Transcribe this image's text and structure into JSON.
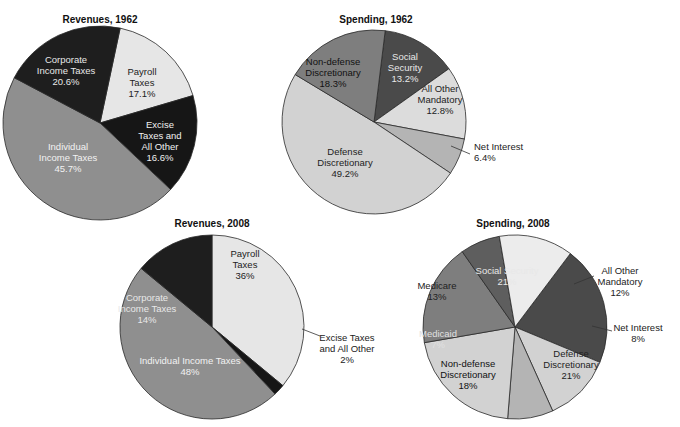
{
  "chart_data": [
    {
      "type": "pie",
      "title": "Revenues, 1962",
      "slices": [
        {
          "label": [
            "Payroll",
            "Taxes",
            "17.1%"
          ],
          "name": "Payroll Taxes",
          "value": 17.1,
          "color": "#e6e6e6",
          "text_color": "#222222"
        },
        {
          "label": [
            "Excise",
            "Taxes and",
            "All Other",
            "16.6%"
          ],
          "name": "Excise Taxes and All Other",
          "value": 16.6,
          "color": "#161616",
          "text_color": "#f0f0f0"
        },
        {
          "label": [
            "Individual",
            "Income Taxes",
            "45.7%"
          ],
          "name": "Individual Income Taxes",
          "value": 45.7,
          "color": "#8f8f8f",
          "text_color": "#f2f2f2"
        },
        {
          "label": [
            "Corporate",
            "Income Taxes",
            "20.6%"
          ],
          "name": "Corporate Income Taxes",
          "value": 20.6,
          "color": "#1e1e1e",
          "text_color": "#e8e8e8"
        }
      ]
    },
    {
      "type": "pie",
      "title": "Spending, 1962",
      "slices": [
        {
          "label": [
            "Social",
            "Security",
            "13.2%"
          ],
          "name": "Social Security",
          "value": 13.2,
          "color": "#4a4a4a",
          "text_color": "#e8e8e8"
        },
        {
          "label": [
            "All Other",
            "Mandatory",
            "12.8%"
          ],
          "name": "All Other Mandatory",
          "value": 12.8,
          "color": "#dcdcdc",
          "text_color": "#222222"
        },
        {
          "label": [
            "Net Interest",
            "6.4%"
          ],
          "name": "Net Interest",
          "value": 6.4,
          "color": "#b4b4b4",
          "text_color": "#222222",
          "callout": true
        },
        {
          "label": [
            "Defense",
            "Discretionary",
            "49.2%"
          ],
          "name": "Defense Discretionary",
          "value": 49.2,
          "color": "#d2d2d2",
          "text_color": "#222222"
        },
        {
          "label": [
            "Non-defense",
            "Discretionary",
            "18.3%"
          ],
          "name": "Non-defense Discretionary",
          "value": 18.3,
          "color": "#7e7e7e",
          "text_color": "#111111"
        }
      ]
    },
    {
      "type": "pie",
      "title": "Revenues, 2008",
      "slices": [
        {
          "label": [
            "Payroll",
            "Taxes",
            "36%"
          ],
          "name": "Payroll Taxes",
          "value": 36,
          "color": "#e6e6e6",
          "text_color": "#222222"
        },
        {
          "label": [
            "Excise Taxes",
            "and All Other",
            "2%"
          ],
          "name": "Excise Taxes and All Other",
          "value": 2,
          "color": "#161616",
          "text_color": "#222222",
          "callout": true
        },
        {
          "label": [
            "Individual Income Taxes",
            "48%"
          ],
          "name": "Individual Income Taxes",
          "value": 48,
          "color": "#8f8f8f",
          "text_color": "#f2f2f2"
        },
        {
          "label": [
            "Corporate",
            "Income Taxes",
            "14%"
          ],
          "name": "Corporate Income Taxes",
          "value": 14,
          "color": "#1e1e1e",
          "text_color": "#e8e8e8"
        }
      ]
    },
    {
      "type": "pie",
      "title": "Spending, 2008",
      "slices": [
        {
          "label": [
            "Social Security",
            "21%"
          ],
          "name": "Social Security",
          "value": 21,
          "color": "#4a4a4a",
          "text_color": "#e8e8e8"
        },
        {
          "label": [
            "All Other",
            "Mandatory",
            "12%"
          ],
          "name": "All Other Mandatory",
          "value": 12,
          "color": "#d2d2d2",
          "text_color": "#222222",
          "callout": true
        },
        {
          "label": [
            "Net Interest",
            "8%"
          ],
          "name": "Net Interest",
          "value": 8,
          "color": "#b4b4b4",
          "text_color": "#222222",
          "callout": true
        },
        {
          "label": [
            "Defense",
            "Discretionary",
            "21%"
          ],
          "name": "Defense Discretionary",
          "value": 21,
          "color": "#d2d2d2",
          "text_color": "#222222"
        },
        {
          "label": [
            "Non-defense",
            "Discretionary",
            "18%"
          ],
          "name": "Non-defense Discretionary",
          "value": 18,
          "color": "#7e7e7e",
          "text_color": "#111111"
        },
        {
          "label": [
            "Medicaid",
            "7%"
          ],
          "name": "Medicaid",
          "value": 7,
          "color": "#5e5e5e",
          "text_color": "#e0e0e0"
        },
        {
          "label": [
            "Medicare",
            "13%"
          ],
          "name": "Medicare",
          "value": 13,
          "color": "#ececec",
          "text_color": "#222222"
        }
      ]
    }
  ]
}
